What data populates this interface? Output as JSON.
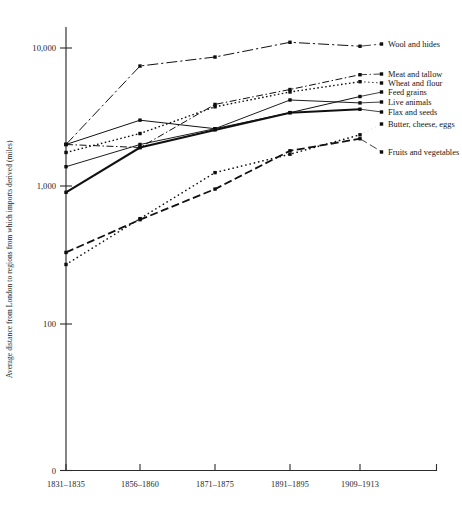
{
  "chart_data": {
    "type": "line",
    "title": "",
    "xlabel": "",
    "ylabel": "Average distance from London to regions from which imports derived (miles)",
    "scale": "log",
    "grid": false,
    "legend_position": "right-inline-labels",
    "categories": [
      "1831–1835",
      "1856–1860",
      "1871–1875",
      "1891–1895",
      "1909–1913"
    ],
    "ytick_labels": [
      "10,000",
      "1,000",
      "100",
      "0"
    ],
    "ytick_values": [
      10000,
      1000,
      100,
      0
    ],
    "ylim": [
      100,
      20000
    ],
    "series": [
      {
        "name": "Wool and hides",
        "dash": "dash-dot",
        "width": 1.0,
        "values": [
          2000,
          7400,
          8600,
          11000,
          10300
        ]
      },
      {
        "name": "Meat and tallow",
        "dash": "dash-dot-fine",
        "width": 1.0,
        "values": [
          2000,
          1900,
          3900,
          5000,
          6400
        ]
      },
      {
        "name": "Wheat and flour",
        "dash": "dotted",
        "width": 1.4,
        "values": [
          1750,
          2400,
          3750,
          4800,
          5700
        ]
      },
      {
        "name": "Feed grains",
        "dash": "solid",
        "width": 1.0,
        "values": [
          2000,
          3000,
          2600,
          3400,
          4450
        ]
      },
      {
        "name": "Live animals",
        "dash": "solid-thin",
        "width": 0.95,
        "values": [
          1380,
          2000,
          2600,
          4200,
          4000
        ]
      },
      {
        "name": "Flax and seeds",
        "dash": "solid-thick",
        "width": 2.1,
        "values": [
          900,
          1900,
          2550,
          3400,
          3600
        ]
      },
      {
        "name": "Butter, cheese, eggs",
        "dash": "dotted-round",
        "width": 1.6,
        "values": [
          270,
          580,
          1250,
          1700,
          2350
        ]
      },
      {
        "name": "Fruits and vegetables",
        "dash": "dashed",
        "width": 1.8,
        "values": [
          330,
          570,
          950,
          1800,
          2200
        ]
      }
    ],
    "legend_entries": [
      {
        "label": "Wool and hides",
        "y": 44
      },
      {
        "label": "Meat and tallow",
        "y": 74
      },
      {
        "label": "Wheat and flour",
        "y": 83
      },
      {
        "label": "Feed grains",
        "y": 92
      },
      {
        "label": "Live animals",
        "y": 102
      },
      {
        "label": "Flax and seeds",
        "y": 112
      },
      {
        "label": "Butter, cheese, eggs",
        "y": 124
      },
      {
        "label": "Fruits and vegetables",
        "y": 152
      }
    ]
  }
}
